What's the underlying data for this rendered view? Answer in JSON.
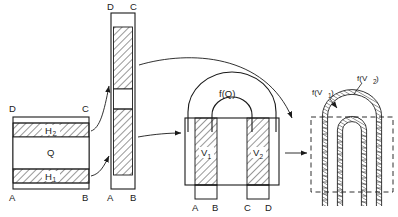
{
  "figure": {
    "title": "",
    "background_color": "#ffffff",
    "line_color": "#1a1a1a",
    "hatch_color": "#1a1a1a",
    "panels": [
      {
        "id": "panel-1",
        "name": "cross-section-block",
        "corner_labels": {
          "top_left": "D",
          "top_right": "C",
          "bottom_left": "A",
          "bottom_right": "B"
        },
        "band_labels": {
          "upper": "H",
          "upper_sub": "2",
          "middle": "Q",
          "lower": "H",
          "lower_sub": "1"
        }
      },
      {
        "id": "panel-2",
        "name": "tall-strip",
        "corner_labels": {
          "top_left": "D",
          "top_right": "C",
          "bottom_left": "A",
          "bottom_right": "B"
        }
      },
      {
        "id": "panel-3",
        "name": "horseshoe-solid",
        "arch_label": "f(Q)",
        "column_labels": {
          "left": "V",
          "left_sub": "1",
          "right": "V",
          "right_sub": "2"
        },
        "foot_labels": [
          "A",
          "B",
          "C",
          "D"
        ]
      },
      {
        "id": "panel-4",
        "name": "horseshoe-dashed-tubes",
        "tube_labels": {
          "inner": "f(V",
          "inner_sub": "1",
          "inner_end": ")",
          "outer": "f(V",
          "outer_sub": "2",
          "outer_end": ")"
        }
      }
    ],
    "connectors": [
      {
        "name": "arrow-block-to-strip-upper",
        "from": "panel-1",
        "to": "panel-2"
      },
      {
        "name": "arrow-block-to-strip-lower",
        "from": "panel-1",
        "to": "panel-2"
      },
      {
        "name": "arrow-strip-top-to-horseshoe",
        "from": "panel-2",
        "to": "panel-3"
      },
      {
        "name": "arrow-strip-mid-to-horseshoe",
        "from": "panel-2",
        "to": "panel-3"
      },
      {
        "name": "arrow-horseshoe-to-tubes",
        "from": "panel-3",
        "to": "panel-4"
      }
    ]
  }
}
